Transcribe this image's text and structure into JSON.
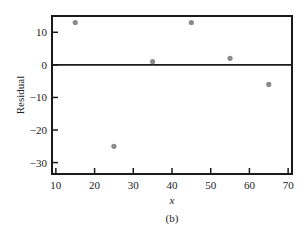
{
  "chart_data": {
    "type": "scatter",
    "title": "",
    "caption": "(b)",
    "xlabel": "x",
    "ylabel": "Residual",
    "xlim": [
      9,
      71
    ],
    "ylim": [
      -33.5,
      15
    ],
    "xticks": [
      10,
      20,
      30,
      40,
      50,
      60,
      70
    ],
    "yticks": [
      -30,
      -20,
      -10,
      0,
      10
    ],
    "xtick_labels": [
      "10",
      "20",
      "30",
      "40",
      "50",
      "60",
      "70"
    ],
    "ytick_labels": [
      "−30",
      "−20",
      "−10",
      "0",
      "10"
    ],
    "grid": false,
    "legend": null,
    "reference_line": {
      "y": 0
    },
    "series": [
      {
        "name": "Residuals",
        "color": "#8a8a8a",
        "x": [
          15,
          25,
          35,
          45,
          55,
          65
        ],
        "y": [
          13,
          -25,
          1,
          13,
          2,
          -6
        ]
      }
    ]
  },
  "layout": {
    "plot_left": 52,
    "plot_right": 292,
    "plot_top": 16,
    "plot_bottom": 174,
    "axis_color": "#1a1a1a",
    "point_color": "#8a8a8a"
  }
}
